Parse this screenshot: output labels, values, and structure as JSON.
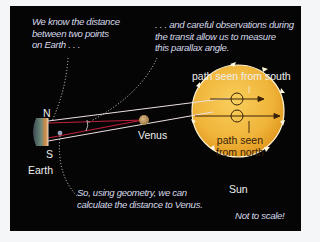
{
  "notes": {
    "top_left": "We know the distance\nbetween two points\non Earth . . .",
    "top_right": ". . . and careful observations during\nthe transit allow us to measure\nthis parallax angle.",
    "bottom": "So, using geometry, we can\ncalculate the distance to Venus.",
    "disclaimer": "Not to scale!"
  },
  "labels": {
    "north": "N",
    "south": "S",
    "earth": "Earth",
    "venus": "Venus",
    "sun": "Sun",
    "path_south": "path seen from south",
    "path_north": "path seen\nfrom north"
  },
  "colors": {
    "background": "#050505",
    "sun": "#f0b43a",
    "venus": "#b8955c",
    "sight_line": "#e8d8d8",
    "parallax_line": "#c0203a",
    "note_text": "#d6d8ea"
  }
}
